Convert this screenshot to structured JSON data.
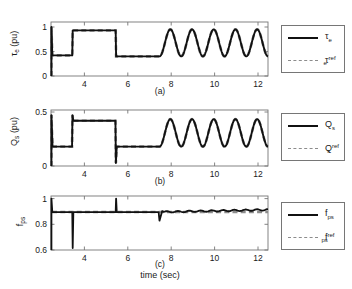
{
  "figure": {
    "xlabel": "time (sec)",
    "panel_tags": [
      "(a)",
      "(b)",
      "(c)"
    ],
    "line_color": "#111111",
    "ref_color": "#8c8c8c",
    "axis_color": "#767676",
    "background": "#ffffff"
  },
  "chart_data": [
    {
      "type": "line",
      "title": "",
      "panel": "(a)",
      "xlabel": "time (sec)",
      "ylabel": "τe (pu)",
      "ylabel_base": "τ",
      "ylabel_sub": "e",
      "ylabel_units": " (pu)",
      "xlim": [
        2.5,
        12.5
      ],
      "ylim": [
        0,
        1.1
      ],
      "xticks": [
        4,
        6,
        8,
        10,
        12
      ],
      "yticks": [
        0,
        0.5,
        1
      ],
      "ytick_labels": [
        "0",
        "0.5",
        "1"
      ],
      "xtick_labels": [
        "4",
        "6",
        "8",
        "10",
        "12"
      ],
      "grid": false,
      "legend_position": "outside-right",
      "series": [
        {
          "name": "τe",
          "name_base": "τ",
          "name_sub": "e",
          "name_sup": "",
          "style": "solid",
          "description": "electromagnetic torque, step references then 1 Hz sinusoid",
          "x": [
            2.5,
            2.52,
            2.55,
            2.6,
            3.45,
            3.5,
            3.55,
            5.45,
            5.5,
            5.55,
            7.45,
            7.5,
            7.55,
            7.75,
            8.0,
            8.25,
            8.5,
            8.75,
            9.0,
            9.25,
            9.5,
            9.75,
            10.0,
            10.25,
            10.5,
            10.75,
            11.0,
            11.25,
            11.5,
            11.75,
            12.0,
            12.25,
            12.5
          ],
          "y": [
            0.0,
            1.0,
            0.42,
            0.42,
            0.42,
            0.93,
            0.93,
            0.93,
            0.4,
            0.4,
            0.4,
            0.4,
            0.45,
            0.95,
            0.4,
            0.95,
            0.4,
            0.95,
            0.4,
            0.95,
            0.4,
            0.95,
            0.4,
            0.95,
            0.4,
            0.95,
            0.4,
            0.95,
            0.4,
            0.95,
            0.4,
            0.95,
            0.62
          ]
        },
        {
          "name": "τe ref",
          "name_base": "τ",
          "name_sub": "e",
          "name_sup": "ref",
          "style": "dashed",
          "description": "torque reference command, overlaps actual torque"
        }
      ],
      "events": {
        "step_times": [
          3.5,
          5.5,
          7.5
        ],
        "sinusoid_start": 7.5,
        "sinusoid_period_sec": 1.0,
        "sinusoid_min": 0.4,
        "sinusoid_max": 0.95
      }
    },
    {
      "type": "line",
      "title": "",
      "panel": "(b)",
      "xlabel": "time (sec)",
      "ylabel": "Qs (pu)",
      "ylabel_base": "Q",
      "ylabel_sub": "s",
      "ylabel_units": " (pu)",
      "xlim": [
        2.5,
        12.5
      ],
      "ylim": [
        0,
        0.55
      ],
      "xticks": [
        4,
        6,
        8,
        10,
        12
      ],
      "yticks": [
        0,
        0.5
      ],
      "ytick_labels": [
        "0",
        "0.5"
      ],
      "xtick_labels": [
        "4",
        "6",
        "8",
        "10",
        "12"
      ],
      "grid": false,
      "legend_position": "outside-right",
      "series": [
        {
          "name": "Qs",
          "name_base": "Q",
          "name_sub": "s",
          "name_sup": "",
          "style": "solid",
          "description": "stator reactive power, step references then 1 Hz sinusoid",
          "x": [
            2.5,
            2.52,
            2.56,
            2.6,
            3.45,
            3.5,
            3.55,
            5.45,
            5.5,
            5.55,
            7.45,
            7.5,
            7.55,
            7.75,
            8.0,
            8.25,
            8.5,
            8.75,
            9.0,
            9.25,
            9.5,
            9.75,
            10.0,
            10.25,
            10.5,
            10.75,
            11.0,
            11.25,
            11.5,
            11.75,
            12.0,
            12.25,
            12.5
          ],
          "y": [
            0.0,
            0.5,
            0.19,
            0.19,
            0.19,
            0.455,
            0.445,
            0.445,
            0.19,
            0.19,
            0.19,
            0.19,
            0.22,
            0.46,
            0.19,
            0.46,
            0.19,
            0.46,
            0.19,
            0.46,
            0.19,
            0.46,
            0.19,
            0.46,
            0.19,
            0.46,
            0.19,
            0.46,
            0.19,
            0.46,
            0.19,
            0.46,
            0.3
          ]
        },
        {
          "name": "Qs ref",
          "name_base": "Q",
          "name_sub": "s",
          "name_sup": "ref",
          "style": "dashed",
          "description": "reactive power reference command, overlaps actual"
        }
      ],
      "events": {
        "step_times": [
          3.5,
          5.5,
          7.5
        ],
        "sinusoid_start": 7.5,
        "sinusoid_period_sec": 1.0,
        "sinusoid_min": 0.19,
        "sinusoid_max": 0.46
      }
    },
    {
      "type": "line",
      "title": "",
      "panel": "(c)",
      "xlabel": "time (sec)",
      "ylabel": "fps",
      "ylabel_base": "f",
      "ylabel_sub": "ps",
      "ylabel_units": "",
      "xlim": [
        2.5,
        12.5
      ],
      "ylim": [
        0.6,
        1.02
      ],
      "xticks": [
        4,
        6,
        8,
        10,
        12
      ],
      "yticks": [
        0.6,
        0.8,
        1
      ],
      "ytick_labels": [
        "0.6",
        "0.8",
        "1"
      ],
      "xtick_labels": [
        "4",
        "6",
        "8",
        "10",
        "12"
      ],
      "grid": false,
      "legend_position": "outside-right",
      "series": [
        {
          "name": "fps",
          "name_base": "f",
          "name_sub": "ps",
          "name_sup": "",
          "style": "solid",
          "description": "power-supply frequency ratio, ~0.9 with transient spikes at step instants and rising ripple after 7.5 s",
          "x": [
            2.5,
            2.52,
            2.6,
            3.45,
            3.5,
            3.55,
            5.45,
            5.5,
            5.55,
            7.45,
            7.5,
            7.55,
            7.7,
            8.0,
            8.25,
            8.5,
            8.75,
            9.0,
            9.5,
            10.0,
            10.5,
            11.0,
            11.5,
            12.0,
            12.5
          ],
          "y": [
            0.6,
            1.0,
            0.895,
            0.895,
            0.615,
            0.895,
            0.895,
            1.0,
            0.895,
            0.895,
            0.83,
            0.9,
            0.895,
            0.905,
            0.898,
            0.908,
            0.9,
            0.91,
            0.905,
            0.912,
            0.908,
            0.915,
            0.91,
            0.918,
            0.905
          ]
        },
        {
          "name": "fps ref",
          "name_base": "f",
          "name_sub": "ps",
          "name_sup": "ref",
          "style": "dashed",
          "description": "frequency reference, flat at 0.895"
        }
      ],
      "events": {
        "spike_times": [
          2.52,
          3.5,
          5.5,
          7.5
        ],
        "baseline": 0.895
      }
    }
  ]
}
